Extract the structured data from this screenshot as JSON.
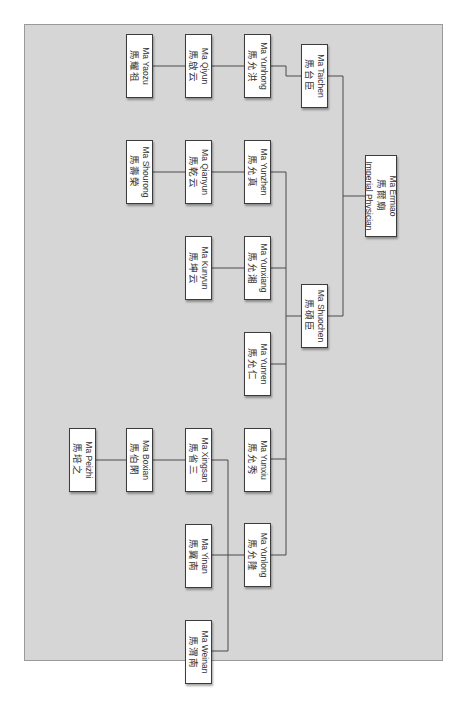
{
  "diagram": {
    "type": "family-tree",
    "orientation": "rotated-90",
    "colors": {
      "background": "#d6d6d6",
      "node_fill": "#ffffff",
      "node_border": "#3c3c3c",
      "line": "#4a4a4a"
    }
  },
  "nodes": {
    "ermiao": {
      "en": "Ma Ermiao",
      "zh": "馬爾廟",
      "title": "Imperial Physician"
    },
    "taichen": {
      "en": "Ma Taichen",
      "zh": "馬台臣"
    },
    "shuochen": {
      "en": "Ma Shuochen",
      "zh": "馬碩臣"
    },
    "yunhong": {
      "en": "Ma Yunhong",
      "zh": "馬允洪"
    },
    "yunzhen": {
      "en": "Ma Yunzhen",
      "zh": "馬允真"
    },
    "yunxiang": {
      "en": "Ma Yunxiang",
      "zh": "馬允湘"
    },
    "yunren": {
      "en": "Ma Yunren",
      "zh": "馬允仁"
    },
    "yunxiu": {
      "en": "Ma Yunxiu",
      "zh": "馬允秀"
    },
    "yunlong": {
      "en": "Ma Yunlong",
      "zh": "馬允隆"
    },
    "qiyun": {
      "en": "Ma Qiyun",
      "zh": "馬啟云"
    },
    "qianyun": {
      "en": "Ma Qianyun",
      "zh": "馬乾云"
    },
    "kunyun": {
      "en": "Ma Kunyun",
      "zh": "馬坤云"
    },
    "xingsan": {
      "en": "Ma Xingsan",
      "zh": "馬省三"
    },
    "yinan": {
      "en": "Ma Yinan",
      "zh": "馬翼南"
    },
    "weinan": {
      "en": "Ma Weinan",
      "zh": "馬渭南"
    },
    "yaozu": {
      "en": "Ma Yaozu",
      "zh": "馬耀祖"
    },
    "shourong": {
      "en": "Ma Shourong",
      "zh": "馬壽榮"
    },
    "boxian": {
      "en": "Ma Boxian",
      "zh": "馬伯閑"
    },
    "peizhi": {
      "en": "Ma Peizhi",
      "zh": "馬培之"
    }
  },
  "edges": [
    [
      "ermiao",
      "taichen"
    ],
    [
      "ermiao",
      "shuochen"
    ],
    [
      "taichen",
      "yunhong"
    ],
    [
      "shuochen",
      "yunzhen"
    ],
    [
      "shuochen",
      "yunxiang"
    ],
    [
      "shuochen",
      "yunren"
    ],
    [
      "shuochen",
      "yunxiu"
    ],
    [
      "shuochen",
      "yunlong"
    ],
    [
      "yunhong",
      "qiyun"
    ],
    [
      "yunzhen",
      "qianyun"
    ],
    [
      "yunxiang",
      "kunyun"
    ],
    [
      "yunlong",
      "xingsan"
    ],
    [
      "yunlong",
      "yinan"
    ],
    [
      "yunlong",
      "weinan"
    ],
    [
      "qiyun",
      "yaozu"
    ],
    [
      "qianyun",
      "shourong"
    ],
    [
      "xingsan",
      "boxian"
    ],
    [
      "boxian",
      "peizhi"
    ]
  ]
}
